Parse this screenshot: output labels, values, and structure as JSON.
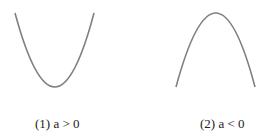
{
  "figures": [
    {
      "label": "(1) a > 0",
      "shape": "upward-parabola"
    },
    {
      "label": "(2) a < 0",
      "shape": "downward-parabola"
    }
  ],
  "colors": {
    "curve": "#808080",
    "text": "#222222"
  }
}
